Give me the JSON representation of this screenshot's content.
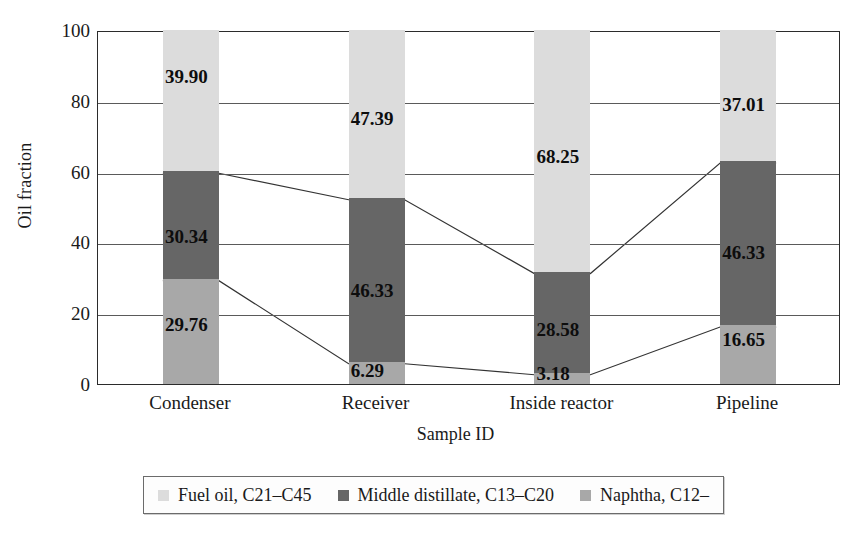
{
  "chart_data": {
    "type": "bar",
    "stacked": true,
    "title": "",
    "xlabel": "Sample ID",
    "ylabel": "Oil fraction",
    "ylim": [
      0,
      100
    ],
    "yticks": [
      0,
      20,
      40,
      60,
      80,
      100
    ],
    "grid": true,
    "legend_position": "bottom",
    "categories": [
      "Condenser",
      "Receiver",
      "Inside reactor",
      "Pipeline"
    ],
    "series": [
      {
        "name": "Fuel oil, C21–C45",
        "color": "#dcdcdc",
        "values": [
          39.9,
          47.39,
          68.25,
          37.01
        ],
        "labels": [
          "39.90",
          "47.39",
          "68.25",
          "37.01"
        ]
      },
      {
        "name": "Middle distillate, C13–C20",
        "color": "#666666",
        "values": [
          30.34,
          46.33,
          28.58,
          46.33
        ],
        "labels": [
          "30.34",
          "46.33",
          "28.58",
          "46.33"
        ]
      },
      {
        "name": "Naphtha, C12–",
        "color": "#a8a8a8",
        "values": [
          29.76,
          6.29,
          3.18,
          16.65
        ],
        "labels": [
          "29.76",
          "6.29",
          "3.18",
          "16.65"
        ]
      }
    ],
    "connector_lines": [
      {
        "name": "naphtha-top-boundary",
        "values": [
          29.76,
          6.29,
          3.18,
          16.65
        ]
      },
      {
        "name": "middle-distillate-top-boundary",
        "values": [
          60.1,
          52.62,
          31.76,
          62.99
        ]
      }
    ]
  },
  "axes": {
    "y_title": "Oil fraction",
    "x_title": "Sample ID",
    "y_tick_labels": [
      "100",
      "80",
      "60",
      "40",
      "20",
      "0"
    ]
  },
  "legend": {
    "items": [
      {
        "label": "Fuel oil, C21–C45",
        "color": "#dcdcdc"
      },
      {
        "label": "Middle distillate, C13–C20",
        "color": "#666666"
      },
      {
        "label": "Naphtha, C12–",
        "color": "#a8a8a8"
      }
    ]
  },
  "colors": {
    "fuel_oil": "#dcdcdc",
    "middle_distillate": "#666666",
    "naphtha": "#a8a8a8",
    "frame": "#2b2b2b",
    "grid": "#5a5a5a",
    "line": "#333333"
  }
}
